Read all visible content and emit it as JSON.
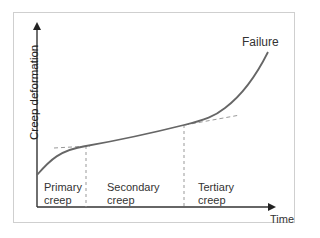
{
  "diagram": {
    "type": "creep-curve",
    "y_axis_label": "Creep deformation",
    "x_axis_label": "Time",
    "endpoint_label": "Failure",
    "regions": [
      {
        "line1": "Primary",
        "line2": "creep"
      },
      {
        "line1": "Secondary",
        "line2": "creep"
      },
      {
        "line1": "Tertiary",
        "line2": "creep"
      }
    ],
    "colors": {
      "curve": "#666666",
      "axis": "#333333",
      "dashed": "#999999",
      "frame": "#cfcfcf",
      "text": "#333333"
    }
  }
}
